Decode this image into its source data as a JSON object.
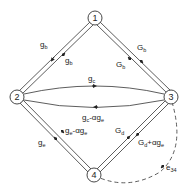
{
  "diagram": {
    "nodes": [
      {
        "id": "1",
        "label": "1"
      },
      {
        "id": "2",
        "label": "2"
      },
      {
        "id": "3",
        "label": "3"
      },
      {
        "id": "4",
        "label": "4"
      }
    ],
    "edges": [
      {
        "from": "2",
        "to": "1",
        "label_main": "g",
        "label_sub": "b"
      },
      {
        "from": "1",
        "to": "2",
        "label_main": "g",
        "label_sub": "b"
      },
      {
        "from": "1",
        "to": "3",
        "label_main": "G",
        "label_sub": "b"
      },
      {
        "from": "3",
        "to": "1",
        "label_main": "G",
        "label_sub": "b"
      },
      {
        "from": "2",
        "to": "3",
        "label_main": "g",
        "label_sub": "c"
      },
      {
        "from": "3",
        "to": "2",
        "label_main": "g",
        "label_sub": "c",
        "label_rest": "-αg",
        "label_rest_sub": "e"
      },
      {
        "from": "4",
        "to": "2",
        "label_main": "g",
        "label_sub": "e"
      },
      {
        "from": "2",
        "to": "4",
        "label_main": "g",
        "label_sub": "e",
        "label_rest": "-αg",
        "label_rest_sub": "e"
      },
      {
        "from": "4",
        "to": "3",
        "label_main": "G",
        "label_sub": "d"
      },
      {
        "from": "3",
        "to": "4",
        "label_main": "G",
        "label_sub": "d",
        "label_rest": "+αg",
        "label_rest_sub": "e"
      },
      {
        "from": "3",
        "to": "4",
        "style": "dashed",
        "label_main": "e",
        "label_sub": "34"
      }
    ]
  }
}
